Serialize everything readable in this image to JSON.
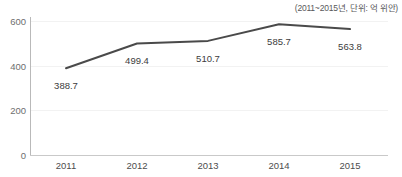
{
  "chart_data": {
    "type": "line",
    "title": "",
    "subtitle": "(2011~2015년, 단위: 억 위안)",
    "categories": [
      "2011",
      "2012",
      "2013",
      "2014",
      "2015"
    ],
    "values": [
      388.7,
      499.4,
      510.7,
      585.7,
      563.8
    ],
    "value_labels": [
      "388.7",
      "499.4",
      "510.7",
      "585.7",
      "563.8"
    ],
    "series": [
      {
        "name": "",
        "values": [
          388.7,
          499.4,
          510.7,
          585.7,
          563.8
        ],
        "color": "#4a4a4a"
      }
    ],
    "xlabel": "",
    "ylabel": "",
    "ylim": [
      0,
      600
    ],
    "yticks": [
      0,
      200,
      400,
      600
    ],
    "ytick_labels": [
      "0",
      "200",
      "400",
      "600"
    ],
    "grid": true,
    "legend": "none",
    "line_color": "#4a4a4a",
    "axis_color": "#c2c2c2",
    "label_color": "#3c3c3c",
    "background": "#ffffff"
  },
  "axis": {
    "y_labels": [
      "600",
      "400",
      "200",
      "0"
    ],
    "x_labels": [
      "2011",
      "2012",
      "2013",
      "2014",
      "2015"
    ]
  },
  "labels": {
    "subtitle": "(2011~2015년, 단위: 억 위안)",
    "points": [
      "388.7",
      "499.4",
      "510.7",
      "585.7",
      "563.8"
    ]
  }
}
